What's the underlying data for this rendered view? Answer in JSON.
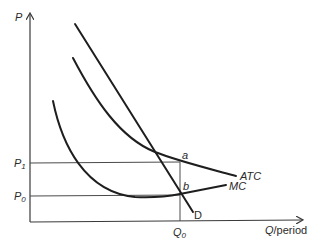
{
  "diagram": {
    "type": "economics-cost-curves",
    "axes": {
      "y_label": "P",
      "x_label_var": "Q",
      "x_label_rest": "/period"
    },
    "price_levels": [
      {
        "label": "P",
        "subscript": "1"
      },
      {
        "label": "P",
        "subscript": "0"
      }
    ],
    "quantity_marker": {
      "label": "Q",
      "subscript": "0"
    },
    "curves": [
      {
        "name": "ATC",
        "label": "ATC"
      },
      {
        "name": "MC",
        "label": "MC"
      },
      {
        "name": "D",
        "label": "D"
      }
    ],
    "points": [
      {
        "name": "a",
        "label": "a"
      },
      {
        "name": "b",
        "label": "b"
      }
    ],
    "colors": {
      "line": "#1e1e1e",
      "axis": "#3a3a3a",
      "text": "#2a2a2a",
      "background": "#ffffff"
    }
  }
}
